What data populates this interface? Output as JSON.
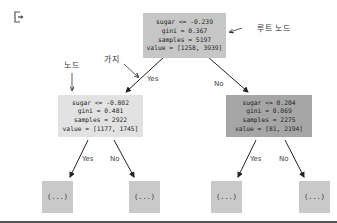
{
  "output_icon": "output-exit-icon",
  "colors": {
    "root": "#c6c6c6",
    "left": "#e2e2e2",
    "right": "#a6a6a6",
    "leaf": "#c9c9c9",
    "edge": "#222222"
  },
  "tree": {
    "root": {
      "condition": "sugar <= -0.239",
      "gini": "gini = 0.367",
      "samples": "samples = 5197",
      "value": "value = [1258, 3939]"
    },
    "left": {
      "condition": "sugar <= -0.802",
      "gini": "gini = 0.481",
      "samples": "samples = 2922",
      "value": "value = [1177, 1745]"
    },
    "right": {
      "condition": "sugar <= 0.204",
      "gini": "gini = 0.069",
      "samples": "samples = 2275",
      "value": "value = [81, 2194]"
    },
    "leaves": [
      "(...)",
      "(...)",
      "(...)",
      "(...)"
    ]
  },
  "edge_labels": {
    "root_yes": "Yes",
    "root_no": "No",
    "left_yes": "Yes",
    "left_no": "No",
    "right_yes": "Yes",
    "right_no": "No"
  },
  "annotations": {
    "root_node": "루트 노드",
    "node": "노드",
    "branch": "가지"
  }
}
